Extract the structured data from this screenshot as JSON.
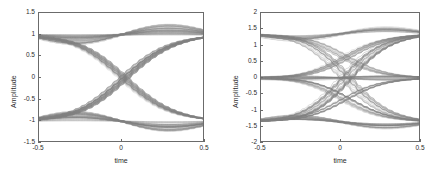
{
  "figure": {
    "background": "#ffffff",
    "trace_color": "#808080",
    "axis_color": "#6b6b6b",
    "text_color": "#2b2b2b"
  },
  "chart_data": [
    {
      "type": "line",
      "name": "eye-diagram-left",
      "title": "",
      "xlabel": "time",
      "ylabel": "Amplitude",
      "xlim": [
        -0.5,
        0.5
      ],
      "ylim": [
        -1.5,
        1.5
      ],
      "xticks": [
        -0.5,
        0,
        0.5
      ],
      "xticklabels": [
        "-0.5",
        "0",
        "0.5"
      ],
      "yticks": [
        1.5,
        1,
        0.5,
        0,
        -0.5,
        -1,
        -1.5
      ],
      "yticklabels": [
        "1.5",
        "1",
        "0.5",
        "0",
        "-0.5",
        "-1",
        "-1.5"
      ],
      "grid": false,
      "legend": "none",
      "description": "Binary eye diagram, overlaid symbol traces, crossings at time 0",
      "levels": [
        1,
        -1
      ],
      "crossing_times": [
        -0.5,
        0,
        0.5
      ],
      "series": [
        {
          "name": "hi-hi",
          "x": [
            -0.5,
            -0.375,
            -0.25,
            -0.125,
            0,
            0.125,
            0.25,
            0.375,
            0.5
          ],
          "values": [
            1.0,
            1.05,
            1.12,
            1.08,
            1.0,
            1.08,
            1.12,
            1.05,
            1.0
          ]
        },
        {
          "name": "hi-hi-b",
          "x": [
            -0.5,
            -0.375,
            -0.25,
            -0.125,
            0,
            0.125,
            0.25,
            0.375,
            0.5
          ],
          "values": [
            1.0,
            1.12,
            1.25,
            1.2,
            1.0,
            1.2,
            1.25,
            1.12,
            1.0
          ]
        },
        {
          "name": "hi-hi-c",
          "x": [
            -0.5,
            -0.375,
            -0.25,
            -0.125,
            0,
            0.125,
            0.25,
            0.375,
            0.5
          ],
          "values": [
            1.0,
            1.2,
            1.4,
            1.35,
            1.0,
            1.35,
            1.4,
            1.2,
            1.0
          ]
        },
        {
          "name": "lo-lo",
          "x": [
            -0.5,
            -0.375,
            -0.25,
            -0.125,
            0,
            0.125,
            0.25,
            0.375,
            0.5
          ],
          "values": [
            -1.0,
            -1.05,
            -1.12,
            -1.08,
            -1.0,
            -1.08,
            -1.12,
            -1.05,
            -1.0
          ]
        },
        {
          "name": "lo-lo-b",
          "x": [
            -0.5,
            -0.375,
            -0.25,
            -0.125,
            0,
            0.125,
            0.25,
            0.375,
            0.5
          ],
          "values": [
            -1.0,
            -1.12,
            -1.25,
            -1.2,
            -1.0,
            -1.2,
            -1.25,
            -1.12,
            -1.0
          ]
        },
        {
          "name": "lo-lo-c",
          "x": [
            -0.5,
            -0.375,
            -0.25,
            -0.125,
            0,
            0.125,
            0.25,
            0.375,
            0.5
          ],
          "values": [
            -1.0,
            -1.2,
            -1.4,
            -1.35,
            -1.0,
            -1.35,
            -1.4,
            -1.2,
            -1.0
          ]
        },
        {
          "name": "hi-lo",
          "x": [
            -0.5,
            -0.25,
            0,
            0.25,
            0.5
          ],
          "values": [
            1.0,
            0.55,
            0.0,
            -0.55,
            -1.0
          ]
        },
        {
          "name": "lo-hi",
          "x": [
            -0.5,
            -0.25,
            0,
            0.25,
            0.5
          ],
          "values": [
            -1.0,
            -0.55,
            0.0,
            0.55,
            1.0
          ]
        },
        {
          "name": "zero-cross-cluster",
          "x": [
            -0.5,
            -0.45,
            -0.4
          ],
          "values": [
            0.0,
            0.05,
            0.0
          ]
        }
      ]
    },
    {
      "type": "line",
      "name": "eye-diagram-right",
      "title": "",
      "xlabel": "time",
      "ylabel": "Amplitude",
      "xlim": [
        -0.5,
        0.5
      ],
      "ylim": [
        -2,
        2
      ],
      "xticks": [
        -0.5,
        0,
        0.5
      ],
      "xticklabels": [
        "-0.5",
        "0",
        "0.5"
      ],
      "yticks": [
        2,
        1.5,
        1,
        0.5,
        0,
        -0.5,
        -1,
        -1.5,
        -2
      ],
      "yticklabels": [
        "2",
        "1.5",
        "1",
        "0.5",
        "0",
        "-0.5",
        "-1",
        "-1.5",
        "-2"
      ],
      "grid": false,
      "legend": "none",
      "description": "Multi-level eye diagram with rails near +1.35, 0 and -1.35; crossings offset left and right of center",
      "levels": [
        1.35,
        0,
        -1.35
      ],
      "crossing_times": [
        -0.25,
        0,
        0.3
      ],
      "series": [
        {
          "name": "rail-hi",
          "x": [
            -0.5,
            -0.25,
            0,
            0.25,
            0.5
          ],
          "values": [
            1.5,
            1.4,
            1.35,
            1.4,
            1.5
          ]
        },
        {
          "name": "rail-hi-b",
          "x": [
            -0.5,
            -0.25,
            0,
            0.25,
            0.5
          ],
          "values": [
            1.58,
            1.45,
            1.35,
            1.45,
            1.58
          ]
        },
        {
          "name": "rail-mid",
          "x": [
            -0.5,
            -0.25,
            0,
            0.25,
            0.5
          ],
          "values": [
            0.0,
            0.0,
            0.0,
            0.0,
            0.0
          ]
        },
        {
          "name": "rail-lo",
          "x": [
            -0.5,
            -0.25,
            0,
            0.25,
            0.5
          ],
          "values": [
            -1.5,
            -1.4,
            -1.35,
            -1.4,
            -1.5
          ]
        },
        {
          "name": "rail-lo-b",
          "x": [
            -0.5,
            -0.25,
            0,
            0.25,
            0.5
          ],
          "values": [
            -1.58,
            -1.45,
            -1.35,
            -1.45,
            -1.58
          ]
        },
        {
          "name": "hi-to-mid",
          "x": [
            -0.5,
            -0.25,
            0,
            0.25,
            0.5
          ],
          "values": [
            0.7,
            0.1,
            -0.35,
            0.2,
            0.9
          ]
        },
        {
          "name": "mid-to-hi",
          "x": [
            -0.5,
            -0.25,
            0,
            0.25,
            0.5
          ],
          "values": [
            -0.7,
            -0.1,
            0.35,
            0.8,
            1.0
          ]
        },
        {
          "name": "lo-to-mid",
          "x": [
            -0.5,
            -0.25,
            0,
            0.25,
            0.5
          ],
          "values": [
            -1.0,
            -0.5,
            -0.3,
            -0.9,
            -1.35
          ]
        },
        {
          "name": "mid-to-lo",
          "x": [
            -0.5,
            -0.25,
            0,
            0.25,
            0.5
          ],
          "values": [
            0.5,
            0.1,
            -0.35,
            -1.0,
            -1.4
          ]
        }
      ]
    }
  ]
}
